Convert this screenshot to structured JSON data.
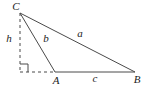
{
  "figure": {
    "background_color": "#ffffff",
    "line_color": "#4a4a4a",
    "text_color": "#1c1c1c",
    "dash_pattern": "3,3",
    "right_angle_mark_size": 8,
    "vertices": {
      "C": {
        "x": 20,
        "y": 13
      },
      "A": {
        "x": 55,
        "y": 72
      },
      "B": {
        "x": 135,
        "y": 72
      },
      "foot": {
        "x": 20,
        "y": 72
      }
    },
    "labels": {
      "C": {
        "text": "C",
        "x": 16,
        "y": 6
      },
      "h": {
        "text": "h",
        "x": 9,
        "y": 38
      },
      "b": {
        "text": "b",
        "x": 46,
        "y": 38
      },
      "a": {
        "text": "a",
        "x": 80,
        "y": 33
      },
      "A": {
        "text": "A",
        "x": 56,
        "y": 80
      },
      "c": {
        "text": "c",
        "x": 95,
        "y": 78
      },
      "B": {
        "text": "B",
        "x": 137,
        "y": 79
      }
    }
  }
}
